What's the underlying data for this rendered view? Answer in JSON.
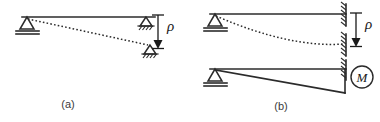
{
  "figure": {
    "background_color": "#ffffff",
    "line_color": "#2b2b2b",
    "text_color": "#1a1a1a",
    "panels": [
      {
        "id": "a",
        "caption": "(a)",
        "caption_x": 68,
        "caption_y": 108,
        "description": "Simply supported beam with pin at left and roller at right; roller settles downward by rho, deflected shape shown dashed",
        "beam": {
          "x1": 22,
          "y1": 17,
          "x2": 155,
          "y2": 17
        },
        "supports": [
          {
            "type": "pin-support",
            "x": 27,
            "y": 17,
            "label": "left-pin-support"
          },
          {
            "type": "roller-support",
            "x": 146,
            "y": 17,
            "label": "right-roller-support-original"
          },
          {
            "type": "roller-support",
            "x": 150,
            "y": 47,
            "label": "right-roller-support-settled"
          }
        ],
        "deflected_shape": {
          "type": "dashed-straight",
          "from_x": 28,
          "from_y": 19,
          "to_x": 148,
          "to_y": 45
        },
        "dimension": {
          "label": "ρ",
          "label_x": 168,
          "label_y": 30,
          "x": 158,
          "top_y": 15,
          "bottom_y": 48,
          "arrow": "down"
        }
      },
      {
        "id": "b",
        "caption": "(b)",
        "caption_x": 281,
        "caption_y": 110,
        "description": "Propped cantilever with pin at left and fixed wall at right; wall settles by rho with curved dashed deflection. Lower diagram shows equivalent applied end moment M",
        "upper": {
          "beam": {
            "x1": 210,
            "y1": 14,
            "x2": 345,
            "y2": 14
          },
          "supports": [
            {
              "type": "pin-support",
              "x": 215,
              "y": 14,
              "label": "left-pin-support"
            },
            {
              "type": "fixed-wall",
              "x": 345,
              "y": 14,
              "label": "fixed-wall-original"
            },
            {
              "type": "fixed-wall",
              "x": 345,
              "y": 44,
              "label": "fixed-wall-settled"
            }
          ],
          "deflected_shape": {
            "type": "dashed-curve",
            "from_x": 216,
            "from_y": 16,
            "ctrl_x": 290,
            "ctrl_y": 48,
            "to_x": 344,
            "to_y": 44
          },
          "dimension": {
            "label": "ρ",
            "label_x": 366,
            "label_y": 28,
            "x": 356,
            "top_y": 13,
            "bottom_y": 46,
            "arrow": "down"
          }
        },
        "lower": {
          "beam": {
            "x1": 210,
            "y1": 69,
            "x2": 345,
            "y2": 69
          },
          "supports": [
            {
              "type": "pin-support",
              "x": 215,
              "y": 69,
              "label": "left-pin-support"
            },
            {
              "type": "fixed-wall",
              "x": 345,
              "y": 69,
              "label": "fixed-wall"
            }
          ],
          "moment_diagram": {
            "type": "triangle",
            "apex_x": 216,
            "apex_y": 70,
            "base_x": 345,
            "base_y": 93,
            "vertical_x": 345,
            "vertical_top_y": 69,
            "vertical_bottom_y": 93
          },
          "moment_marker": {
            "label": "M",
            "cx": 362,
            "cy": 77,
            "r": 11
          }
        }
      }
    ]
  }
}
